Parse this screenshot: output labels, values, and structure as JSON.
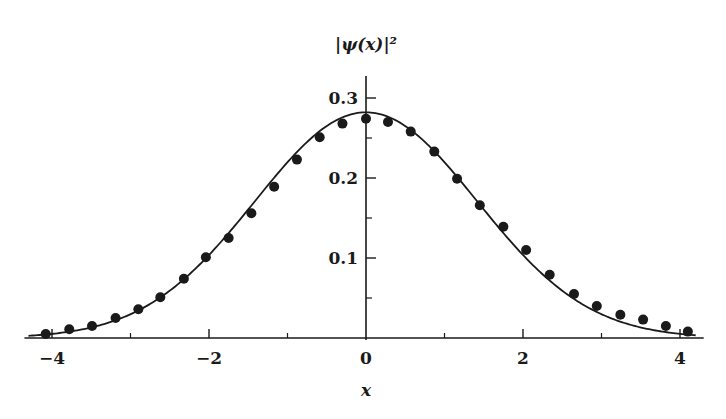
{
  "chart_data": {
    "type": "scatter",
    "title": "",
    "xlabel": "x",
    "ylabel": "|ψ(x)|²",
    "xlim": [
      -4.3,
      4.2
    ],
    "ylim": [
      0,
      0.32
    ],
    "grid": false,
    "x_ticks": [
      {
        "value": -4,
        "label": "−4"
      },
      {
        "value": -2,
        "label": "−2"
      },
      {
        "value": 0,
        "label": "0"
      },
      {
        "value": 2,
        "label": "2"
      },
      {
        "value": 4,
        "label": "4"
      }
    ],
    "x_minor_ticks": [
      -3,
      -1,
      1,
      3
    ],
    "y_ticks": [
      {
        "value": 0.1,
        "label": "0.1"
      },
      {
        "value": 0.2,
        "label": "0.2"
      },
      {
        "value": 0.3,
        "label": "0.3"
      }
    ],
    "y_minor_ticks": [
      0.05,
      0.15,
      0.25
    ],
    "series": [
      {
        "name": "exact",
        "kind": "line",
        "function": "exp(-x^2/4)/sqrt(4*pi)",
        "x_range": [
          -4.3,
          4.2
        ]
      },
      {
        "name": "samples",
        "kind": "points",
        "x": [
          -4.08,
          -3.78,
          -3.49,
          -3.19,
          -2.9,
          -2.62,
          -2.32,
          -2.04,
          -1.75,
          -1.46,
          -1.17,
          -0.88,
          -0.59,
          -0.3,
          0.0,
          0.28,
          0.57,
          0.87,
          1.16,
          1.45,
          1.75,
          2.04,
          2.34,
          2.65,
          2.94,
          3.24,
          3.53,
          3.82,
          4.1
        ],
        "y": [
          0.005,
          0.011,
          0.015,
          0.025,
          0.036,
          0.051,
          0.074,
          0.101,
          0.125,
          0.156,
          0.189,
          0.223,
          0.251,
          0.268,
          0.274,
          0.27,
          0.258,
          0.233,
          0.199,
          0.166,
          0.139,
          0.11,
          0.079,
          0.055,
          0.04,
          0.029,
          0.023,
          0.015,
          0.008
        ]
      }
    ],
    "colors": {
      "ink": "#1a1a1a"
    }
  }
}
